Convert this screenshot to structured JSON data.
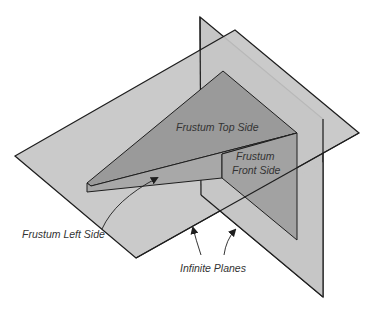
{
  "diagram": {
    "labels": {
      "top_side": "Frustum Top Side",
      "front_side_1": "Frustum",
      "front_side_2": "Front Side",
      "left_side": "Frustum Left Side",
      "planes": "Infinite Planes"
    },
    "colors": {
      "background": "#ffffff",
      "plane_fill": "#c6c6c6",
      "frustum_top_fill": "#9a9a9a",
      "frustum_left_fill": "#a8a8a8",
      "frustum_front_fill": "#a2a2a2",
      "outline": "#1e1e1e"
    }
  }
}
